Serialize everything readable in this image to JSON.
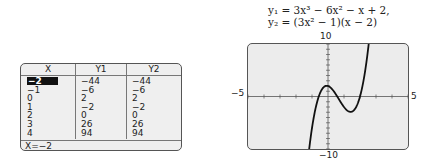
{
  "table": {
    "headers": [
      "X",
      "Y1",
      "Y2"
    ],
    "rows": [
      [
        "−2",
        "−44",
        "−44"
      ],
      [
        "−1",
        "−6",
        "−6"
      ],
      [
        "0",
        "2",
        "2"
      ],
      [
        "1",
        "−2",
        "−2"
      ],
      [
        "2",
        "0",
        "0"
      ],
      [
        "3",
        "26",
        "26"
      ],
      [
        "4",
        "94",
        "94"
      ]
    ],
    "selected_row": 0,
    "status": "X=−2"
  },
  "equations": {
    "line1": "y₁ = 3x³ − 6x² − x + 2,",
    "line2": "y₂ = (3x² − 1)(x − 2)"
  },
  "graph": {
    "ymax_label": "10",
    "ymin_label": "−10",
    "xmin_label": "−5",
    "xmax_label": "5"
  },
  "chart_data": {
    "type": "line",
    "title": "",
    "series": [
      {
        "name": "y1 = 3x^3 - 6x^2 - x + 2",
        "x": [
          -2,
          -1,
          0,
          1,
          2,
          3,
          4
        ],
        "values": [
          -44,
          -6,
          2,
          -2,
          0,
          26,
          94
        ]
      },
      {
        "name": "y2 = (3x^2 - 1)(x - 2)",
        "x": [
          -2,
          -1,
          0,
          1,
          2,
          3,
          4
        ],
        "values": [
          -44,
          -6,
          2,
          -2,
          0,
          26,
          94
        ]
      }
    ],
    "xlabel": "",
    "ylabel": "",
    "xlim": [
      -5,
      5
    ],
    "ylim": [
      -10,
      10
    ],
    "grid": false,
    "table": {
      "columns": [
        "X",
        "Y1",
        "Y2"
      ],
      "rows": [
        [
          -2,
          -44,
          -44
        ],
        [
          -1,
          -6,
          -6
        ],
        [
          0,
          2,
          2
        ],
        [
          1,
          -2,
          -2
        ],
        [
          2,
          0,
          0
        ],
        [
          3,
          26,
          26
        ],
        [
          4,
          94,
          94
        ]
      ]
    }
  }
}
